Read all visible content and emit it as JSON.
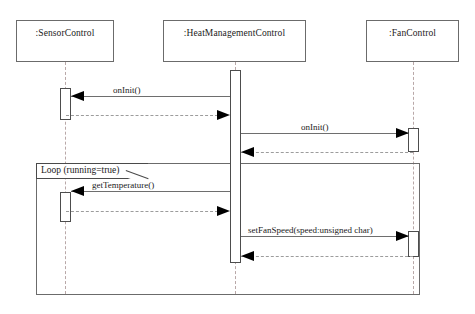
{
  "diagram": {
    "type": "uml-sequence-diagram",
    "width": 475,
    "height": 314,
    "background_color": "#ffffff",
    "line_color": "#6b6b6b",
    "text_color": "#1b1b1b",
    "lifeline_color": "#b9a8a8"
  },
  "participants": [
    {
      "id": "sensor",
      "label": ":SensorControl"
    },
    {
      "id": "heat",
      "label": ":HeatManagementControl"
    },
    {
      "id": "fan",
      "label": ":FanControl"
    }
  ],
  "messages": [
    {
      "id": "m1",
      "label": "onInit()",
      "from": "heat",
      "to": "sensor",
      "kind": "call"
    },
    {
      "id": "m1r",
      "label": "",
      "from": "sensor",
      "to": "heat",
      "kind": "return"
    },
    {
      "id": "m2",
      "label": "onInit()",
      "from": "heat",
      "to": "fan",
      "kind": "call"
    },
    {
      "id": "m2r",
      "label": "",
      "from": "fan",
      "to": "heat",
      "kind": "return"
    },
    {
      "id": "m3",
      "label": "getTemperature()",
      "from": "heat",
      "to": "sensor",
      "kind": "call"
    },
    {
      "id": "m3r",
      "label": "",
      "from": "sensor",
      "to": "heat",
      "kind": "return"
    },
    {
      "id": "m4",
      "label": "setFanSpeed(speed:unsigned char)",
      "from": "heat",
      "to": "fan",
      "kind": "call"
    },
    {
      "id": "m4r",
      "label": "",
      "from": "fan",
      "to": "heat",
      "kind": "return"
    }
  ],
  "fragments": [
    {
      "id": "loop",
      "label": "Loop (running=true)",
      "operator": "Loop",
      "guard": "running=true"
    }
  ]
}
